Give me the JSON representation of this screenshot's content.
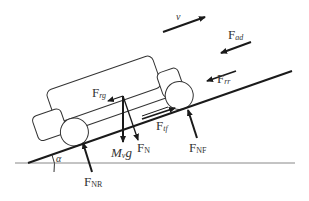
{
  "diagram": {
    "angle_label": "α",
    "labels": {
      "velocity": "v",
      "aero_drag": {
        "main": "F",
        "sub": "ad"
      },
      "rolling_resistance": {
        "main": "F",
        "sub": "rr"
      },
      "tractive_force": {
        "main": "F",
        "sub": "tf"
      },
      "grade_resistance": {
        "main": "F",
        "sub": "rg"
      },
      "weight": {
        "main": "M",
        "sub": "v",
        "tail": "g"
      },
      "normal": {
        "main": "F",
        "sub": "N"
      },
      "normal_front": {
        "main": "F",
        "sub": "NF"
      },
      "normal_rear": {
        "main": "F",
        "sub": "NR"
      }
    },
    "colors": {
      "line": "#1a1a1a",
      "ground": "#888888",
      "text": "#333333"
    }
  }
}
